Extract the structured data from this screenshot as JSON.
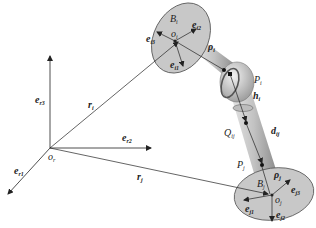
{
  "diagram": {
    "reference_frame": {
      "origin_label": "o",
      "origin_sub": "r",
      "axes": [
        {
          "base": "e",
          "sub": "r1"
        },
        {
          "base": "e",
          "sub": "r2"
        },
        {
          "base": "e",
          "sub": "r3"
        }
      ]
    },
    "body_i": {
      "name": "B",
      "name_sub": "i",
      "origin": "o",
      "origin_sub": "i",
      "axes": [
        {
          "base": "e",
          "sub": "i1"
        },
        {
          "base": "e",
          "sub": "i2"
        },
        {
          "base": "e",
          "sub": "i3"
        }
      ],
      "position_vector": {
        "base": "r",
        "sub": "i"
      },
      "attach_vector": {
        "base": "ρ",
        "sub": "i"
      },
      "attach_point": {
        "base": "P",
        "sub": "i"
      }
    },
    "body_j": {
      "name": "B",
      "name_sub": "j",
      "origin": "o",
      "origin_sub": "j",
      "axes": [
        {
          "base": "e",
          "sub": "j1"
        },
        {
          "base": "e",
          "sub": "j2"
        },
        {
          "base": "e",
          "sub": "j3"
        }
      ],
      "position_vector": {
        "base": "r",
        "sub": "j"
      },
      "attach_vector": {
        "base": "ρ",
        "sub": "j"
      },
      "attach_point": {
        "base": "P",
        "sub": "j"
      }
    },
    "link": {
      "offset_vector": {
        "base": "h",
        "sub": "i"
      },
      "intermediate_point": {
        "base": "Q",
        "sub": "ij"
      },
      "distance_vector": {
        "base": "d",
        "sub": "ij"
      }
    },
    "colors": {
      "disk_fill": "#c8c8c8",
      "disk_stroke": "#555555",
      "link_fill": "#b4b4b4",
      "line": "#222222"
    }
  }
}
